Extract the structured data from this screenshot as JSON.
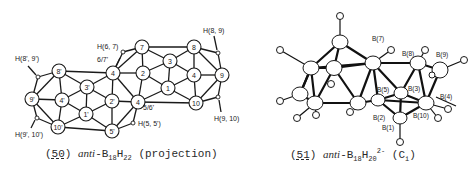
{
  "figure_50": {
    "caption_number": "50",
    "caption_prefix": "anti",
    "caption_formula": "-B",
    "caption_b_sub": "18",
    "caption_h": "H",
    "caption_h_sub": "22",
    "caption_suffix": "(projection)",
    "nodes": [
      {
        "id": "7",
        "label": "7"
      },
      {
        "id": "8",
        "label": "8"
      },
      {
        "id": "3",
        "label": "3"
      },
      {
        "id": "6_7p",
        "label": "4"
      },
      {
        "id": "2",
        "label": "2"
      },
      {
        "id": "4",
        "label": "4"
      },
      {
        "id": "9",
        "label": "9"
      },
      {
        "id": "1",
        "label": "1"
      },
      {
        "id": "10",
        "label": "10"
      },
      {
        "id": "5_6p",
        "label": "4"
      },
      {
        "id": "8p",
        "label": "8'"
      },
      {
        "id": "3p",
        "label": "3'"
      },
      {
        "id": "9p",
        "label": "9'"
      },
      {
        "id": "4p",
        "label": "4'"
      },
      {
        "id": "2p",
        "label": "2'"
      },
      {
        "id": "1p",
        "label": "1'"
      },
      {
        "id": "10p",
        "label": "10'"
      },
      {
        "id": "5p",
        "label": "5'"
      }
    ],
    "annotations": {
      "h89": "H(8, 9)",
      "h910": "H(9, 10)",
      "h67": "H(6, 7)",
      "h55p": "H(5, 5')",
      "h8p9p": "H(8', 9')",
      "h9p10p": "H(9', 10')",
      "l67p": "6/7'",
      "l56p": "5/6'"
    }
  },
  "figure_51": {
    "caption_number": "51",
    "caption_prefix": "anti",
    "caption_formula": "-B",
    "caption_b_sub": "18",
    "caption_h": "H",
    "caption_h_sub": "20",
    "caption_charge": "2-",
    "caption_symmetry": "(C",
    "caption_symmetry_sub": "i",
    "caption_close": ")",
    "atom_labels": {
      "b7": "B(7)",
      "b8": "B(8)",
      "b9": "B(9)",
      "b5": "B(5)",
      "b3": "B(3)",
      "b4": "B(4)",
      "b2": "B(2)",
      "b10": "B(10)",
      "b1": "B(1)"
    }
  }
}
